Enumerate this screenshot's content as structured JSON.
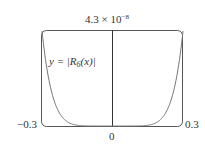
{
  "chart_data": {
    "type": "line",
    "title": "",
    "xlabel": "",
    "ylabel": "",
    "xlim": [
      -0.3,
      0.3
    ],
    "ylim": [
      0,
      4.3e-08
    ],
    "x_tick_labels": [
      "-0.3",
      "0",
      "0.3"
    ],
    "y_tick_labels": [
      "4.3 × 10^-8"
    ],
    "grid": false,
    "legend": null,
    "annotations": [
      "y = |R6(x)|"
    ],
    "series": [
      {
        "name": "y = |R6(x)|",
        "x": [
          -0.3,
          -0.25,
          -0.2,
          -0.15,
          -0.1,
          -0.05,
          0,
          0.05,
          0.1,
          0.15,
          0.2,
          0.25,
          0.3
        ],
        "y": [
          4.3e-08,
          1.2e-08,
          2.5e-09,
          3.4e-10,
          3e-11,
          1e-12,
          0,
          1e-12,
          3e-11,
          3.4e-10,
          2.5e-09,
          1.2e-08,
          4.3e-08
        ]
      }
    ]
  },
  "labels": {
    "ymax_base": "4.3 × 10",
    "ymax_exp": "−8",
    "xmin": "−0.3",
    "xmax": "0.3",
    "xzero": "0",
    "curve_prefix": "y = |R",
    "curve_sub": "6",
    "curve_suffix": "(x)|"
  }
}
